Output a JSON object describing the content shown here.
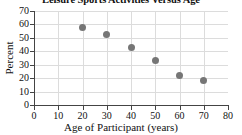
{
  "chart_data": {
    "type": "scatter",
    "title": "Leisure Sports Activities Versus Age",
    "xlabel": "Age of Participant (years)",
    "ylabel": "Percent",
    "xlim": [
      0,
      80
    ],
    "ylim": [
      0,
      70
    ],
    "xticks": [
      0,
      10,
      20,
      30,
      40,
      50,
      60,
      70,
      80
    ],
    "yticks": [
      0,
      10,
      20,
      30,
      40,
      50,
      60,
      70
    ],
    "grid": true,
    "legend": null,
    "marker_color": "#767676",
    "x": [
      20,
      30,
      40,
      50,
      60,
      70
    ],
    "values": [
      57.5,
      52.5,
      43,
      33,
      22,
      18
    ],
    "points": [
      {
        "x": 20,
        "y": 57.5
      },
      {
        "x": 30,
        "y": 52.5
      },
      {
        "x": 40,
        "y": 43
      },
      {
        "x": 50,
        "y": 33
      },
      {
        "x": 60,
        "y": 22
      },
      {
        "x": 70,
        "y": 18
      }
    ]
  }
}
